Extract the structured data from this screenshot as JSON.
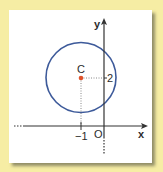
{
  "figure": {
    "title": "",
    "axes": {
      "x_label": "x",
      "y_label": "y",
      "origin_label": "O"
    },
    "center": {
      "label": "C",
      "x_tick_label": "−1",
      "y_tick_label": "2",
      "coords": [
        -1,
        2
      ]
    },
    "circle": {
      "center": [
        -1,
        2
      ],
      "stroke_color": "#3d5a9a"
    },
    "colors": {
      "background": "#f6eda4",
      "card": "#ffffff",
      "axis": "#333333",
      "circle": "#3d5a9a",
      "center_point": "#e0532b",
      "guide_lines": "#999999"
    }
  }
}
